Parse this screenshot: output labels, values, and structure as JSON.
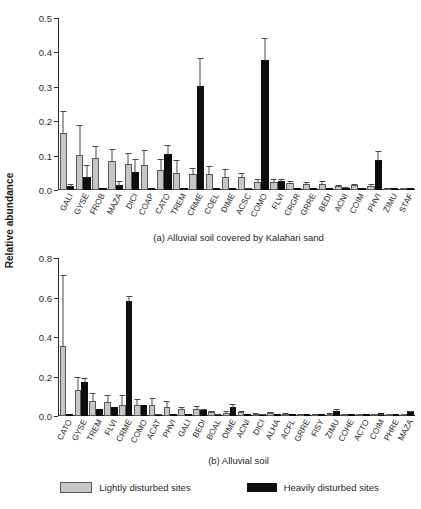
{
  "axis_title": "Relative abundance",
  "legend": {
    "items": [
      {
        "label": "Lightly disturbed sites",
        "color": "#c6c6c6",
        "key": "light"
      },
      {
        "label": "Heavily disturbed sites",
        "color": "#0d0d0d",
        "key": "heavy"
      }
    ]
  },
  "chart_data": [
    {
      "type": "bar",
      "panel": "a",
      "title": "(a) Alluvial soil covered by Kalahari sand",
      "xlabel": "",
      "ylabel": "Relative abundance",
      "ylim": [
        0.0,
        0.5
      ],
      "yticks": [
        0.0,
        0.1,
        0.2,
        0.3,
        0.4,
        0.5
      ],
      "ytick_labels": [
        "0.0",
        "0.1",
        "0.2",
        "0.3",
        "0.4",
        "0.5"
      ],
      "grid": false,
      "legend_position": "bottom",
      "categories": [
        "GALI",
        "GYSE",
        "FROB",
        "MAZA",
        "DICI",
        "COAP",
        "CATO",
        "TREM",
        "CRME",
        "COEL",
        "DIME",
        "ACSC",
        "COMO",
        "FLVI",
        "CRGR",
        "GRRE",
        "BEDI",
        "ACNI",
        "COIM",
        "PHVI",
        "ZIMU",
        "STAF"
      ],
      "series": [
        {
          "name": "Lightly disturbed sites",
          "color": "#c6c6c6",
          "values": [
            0.165,
            0.103,
            0.094,
            0.085,
            0.077,
            0.072,
            0.058,
            0.05,
            0.046,
            0.046,
            0.039,
            0.038,
            0.023,
            0.024,
            0.019,
            0.018,
            0.018,
            0.012,
            0.014,
            0.012,
            0.004,
            0.002
          ],
          "errors": [
            0.069,
            0.089,
            0.036,
            0.037,
            0.033,
            0.046,
            0.034,
            0.04,
            0.022,
            0.028,
            0.025,
            0.014,
            0.012,
            0.01,
            0.009,
            0.007,
            0.01,
            0.006,
            0.006,
            0.008,
            0.004,
            0.001
          ]
        },
        {
          "name": "Heavily disturbed sites",
          "color": "#0d0d0d",
          "values": [
            0.011,
            0.038,
            0.0,
            0.016,
            0.053,
            0.0,
            0.105,
            0.0,
            0.301,
            0.0,
            0.0,
            0.003,
            0.377,
            0.027,
            0.0,
            0.0,
            0.0,
            0.007,
            0.0,
            0.087,
            0.0,
            0.0
          ],
          "errors": [
            0.008,
            0.039,
            0.0,
            0.013,
            0.041,
            0.0,
            0.03,
            0.0,
            0.085,
            0.0,
            0.0,
            0.003,
            0.067,
            0.008,
            0.0,
            0.0,
            0.0,
            0.005,
            0.0,
            0.029,
            0.0,
            0.0
          ]
        }
      ]
    },
    {
      "type": "bar",
      "panel": "b",
      "title": "(b) Alluvial soil",
      "xlabel": "",
      "ylabel": "Relative abundance",
      "ylim": [
        0.0,
        0.8
      ],
      "yticks": [
        0.0,
        0.2,
        0.4,
        0.6,
        0.8
      ],
      "ytick_labels": [
        "0.0",
        "0.2",
        "0.4",
        "0.6",
        "0.8"
      ],
      "grid": false,
      "legend_position": "bottom",
      "categories": [
        "CATO",
        "GYSE",
        "TREM",
        "FLVI",
        "CRME",
        "COMO",
        "ACAT",
        "PHVI",
        "GALI",
        "BEDI",
        "BOAL",
        "DIME",
        "ACNI",
        "DICI",
        "ALHA",
        "ACFL",
        "GRRE",
        "FISY",
        "ZIMU",
        "COHE",
        "ACTO",
        "COIM",
        "PHRE",
        "MAZA"
      ],
      "series": [
        {
          "name": "Lightly disturbed sites",
          "color": "#c6c6c6",
          "values": [
            0.357,
            0.134,
            0.077,
            0.07,
            0.055,
            0.055,
            0.054,
            0.048,
            0.034,
            0.034,
            0.02,
            0.017,
            0.018,
            0.012,
            0.014,
            0.01,
            0.01,
            0.007,
            0.011,
            0.002,
            0.002,
            0.002,
            0.003,
            0.002
          ],
          "errors": [
            0.36,
            0.07,
            0.046,
            0.04,
            0.057,
            0.035,
            0.04,
            0.032,
            0.016,
            0.022,
            0.013,
            0.011,
            0.011,
            0.009,
            0.009,
            0.008,
            0.007,
            0.005,
            0.008,
            0.002,
            0.001,
            0.002,
            0.002,
            0.002
          ]
        },
        {
          "name": "Heavily disturbed sites",
          "color": "#0d0d0d",
          "values": [
            0.0,
            0.17,
            0.036,
            0.045,
            0.58,
            0.054,
            0.007,
            0.0,
            0.0,
            0.028,
            0.007,
            0.044,
            0.0,
            0.005,
            0.0,
            0.0,
            0.0,
            0.0,
            0.026,
            0.0,
            0.0,
            0.013,
            0.0,
            0.023
          ],
          "errors": [
            0.0,
            0.029,
            0.0,
            0.0,
            0.035,
            0.0,
            0.004,
            0.0,
            0.0,
            0.013,
            0.004,
            0.02,
            0.0,
            0.003,
            0.0,
            0.0,
            0.0,
            0.0,
            0.014,
            0.0,
            0.0,
            0.004,
            0.0,
            0.007
          ]
        }
      ]
    }
  ]
}
